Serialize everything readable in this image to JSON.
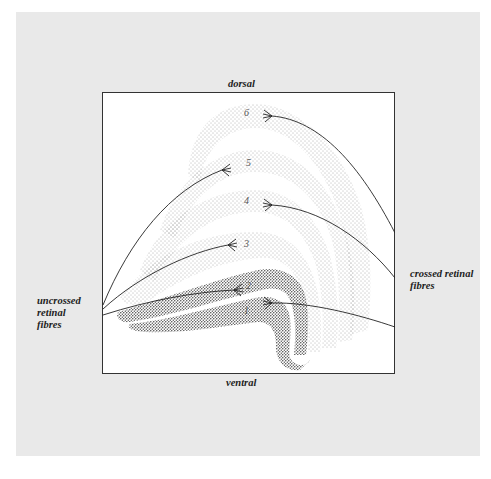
{
  "diagram": {
    "type": "anatomical cross-section (layered nucleus with retinal fibre inputs)",
    "orientation": {
      "top_label": "dorsal",
      "bottom_label": "ventral"
    },
    "inputs": {
      "left_label_lines": [
        "uncrossed",
        "retinal",
        "fibres"
      ],
      "right_label_lines": [
        "crossed retinal",
        "fibres"
      ]
    },
    "layers": [
      {
        "id": "1",
        "label": "1",
        "stipple": "coarse-dark",
        "input": "crossed"
      },
      {
        "id": "2",
        "label": "2",
        "stipple": "coarse-dark",
        "input": "uncrossed"
      },
      {
        "id": "3",
        "label": "3",
        "stipple": "fine-light",
        "input": "uncrossed"
      },
      {
        "id": "4",
        "label": "4",
        "stipple": "fine-light",
        "input": "crossed"
      },
      {
        "id": "5",
        "label": "5",
        "stipple": "fine-light",
        "input": "uncrossed"
      },
      {
        "id": "6",
        "label": "6",
        "stipple": "fine-light",
        "input": "crossed"
      }
    ],
    "colors": {
      "panel_background": "#e9e9e9",
      "frame_fill": "#ffffff",
      "ink": "#222222"
    }
  }
}
